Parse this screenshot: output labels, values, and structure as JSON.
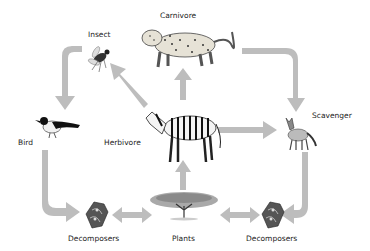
{
  "diagram": {
    "type": "food-web",
    "nodes": {
      "carnivore": {
        "label": "Carnivore",
        "animal": "leopard"
      },
      "insect": {
        "label": "Insect",
        "animal": "fly"
      },
      "bird": {
        "label": "Bird",
        "animal": "magpie"
      },
      "herbivore": {
        "label": "Herbivore",
        "animal": "zebra"
      },
      "scavenger": {
        "label": "Scavenger",
        "animal": "jackal"
      },
      "plants": {
        "label": "Plants",
        "animal": "acacia-tree"
      },
      "decomposers_left": {
        "label": "Decomposers",
        "animal": "fungi-bacteria"
      },
      "decomposers_right": {
        "label": "Decomposers",
        "animal": "fungi-bacteria"
      }
    },
    "edges": [
      {
        "from": "herbivore",
        "to": "insect"
      },
      {
        "from": "herbivore",
        "to": "carnivore"
      },
      {
        "from": "herbivore",
        "to": "scavenger"
      },
      {
        "from": "plants",
        "to": "herbivore"
      },
      {
        "from": "insect",
        "to": "bird"
      },
      {
        "from": "carnivore",
        "to": "scavenger"
      },
      {
        "from": "bird",
        "to": "decomposers_left"
      },
      {
        "from": "scavenger",
        "to": "decomposers_right"
      },
      {
        "from": "plants",
        "to": "decomposers_left",
        "bidirectional": true
      },
      {
        "from": "plants",
        "to": "decomposers_right",
        "bidirectional": true
      }
    ],
    "arrow_color": "#bdbdbd"
  }
}
